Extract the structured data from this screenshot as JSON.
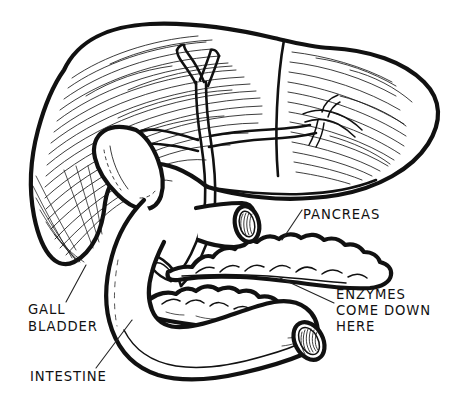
{
  "figure": {
    "background_color": "#ffffff",
    "ink_color": "#111111",
    "style": "pen-and-ink line drawing with hatching"
  },
  "labels": {
    "pancreas": {
      "text": "PANCREAS",
      "lines": [
        "PANCREAS"
      ]
    },
    "enzymes": {
      "text": "ENZYMES COME DOWN HERE",
      "lines": [
        "ENZYMES",
        "COME DOWN",
        "HERE"
      ],
      "line1": "ENZYMES",
      "line2": "COME DOWN",
      "line3": "HERE"
    },
    "gall_bladder": {
      "text": "GALL BLADDER",
      "lines": [
        "GALL",
        "BLADDER"
      ],
      "line1": "GALL",
      "line2": "BLADDER"
    },
    "intestine": {
      "text": "INTESTINE",
      "lines": [
        "INTESTINE"
      ]
    }
  },
  "organs": [
    {
      "name": "liver",
      "label_shown": false
    },
    {
      "name": "gall-bladder",
      "label_shown": true
    },
    {
      "name": "bile-duct",
      "label_shown": false
    },
    {
      "name": "pancreas",
      "label_shown": true
    },
    {
      "name": "intestine",
      "label_shown": true
    }
  ]
}
